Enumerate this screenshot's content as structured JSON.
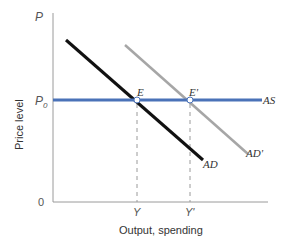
{
  "diagram": {
    "type": "economics-ad-as",
    "y_axis": {
      "top_label": "P",
      "title": "Price level",
      "origin_label": "0"
    },
    "x_axis": {
      "title": "Output, spending"
    },
    "price_levels": [
      {
        "label": "P",
        "subscript": "0"
      }
    ],
    "curves": [
      {
        "name": "AS",
        "label": "AS",
        "color": "#4a72b8",
        "shape": "horizontal"
      },
      {
        "name": "AD",
        "label": "AD",
        "color": "#111111",
        "shape": "downward-sloping"
      },
      {
        "name": "AD'",
        "label": "AD'",
        "color": "#a6a6a6",
        "shape": "downward-sloping"
      }
    ],
    "equilibria": [
      {
        "label": "E",
        "x_label": "Y"
      },
      {
        "label": "E'",
        "x_label": "Y'"
      }
    ],
    "colors": {
      "axis": "#9a9a9a",
      "as_line": "#4a72b8",
      "ad_line": "#111111",
      "ad_prime_line": "#a6a6a6",
      "guide": "#9a9a9a",
      "text": "#333333"
    }
  }
}
